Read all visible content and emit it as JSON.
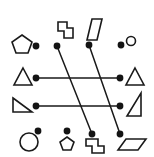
{
  "figure": {
    "width": 154,
    "height": 157,
    "background_color": "#ffffff",
    "stroke_color": "#1a1a1a",
    "dot_color": "#141414"
  },
  "chart_data": {
    "type": "scatter",
    "title": "",
    "xlabel": "",
    "ylabel": "",
    "xlim": [
      0,
      154
    ],
    "ylim": [
      0,
      157
    ],
    "grid": false,
    "legend": "none",
    "nodes": [
      {
        "id": "n1",
        "x": 57,
        "y": 46,
        "label": "top-left-node"
      },
      {
        "id": "n2",
        "x": 89,
        "y": 45,
        "label": "top-mid-node"
      },
      {
        "id": "n3",
        "x": 121,
        "y": 45,
        "label": "top-right-node"
      },
      {
        "id": "n4",
        "x": 36,
        "y": 46,
        "label": "row1-left-node"
      },
      {
        "id": "n5",
        "x": 36,
        "y": 78,
        "label": "row2-left-node"
      },
      {
        "id": "n6",
        "x": 120,
        "y": 78,
        "label": "row2-right-node"
      },
      {
        "id": "n7",
        "x": 36,
        "y": 106,
        "label": "row3-left-node"
      },
      {
        "id": "n8",
        "x": 120,
        "y": 106,
        "label": "row3-right-node"
      },
      {
        "id": "n9",
        "x": 38,
        "y": 131,
        "label": "bottom-left-node"
      },
      {
        "id": "n10",
        "x": 67,
        "y": 131,
        "label": "bottom-mid-node"
      },
      {
        "id": "n11",
        "x": 92,
        "y": 134,
        "label": "bottom-midright-node"
      },
      {
        "id": "n12",
        "x": 120,
        "y": 134,
        "label": "bottom-right-node"
      }
    ],
    "edges": [
      {
        "from": "n5",
        "to": "n6",
        "kind": "horizontal"
      },
      {
        "from": "n7",
        "to": "n8",
        "kind": "horizontal"
      },
      {
        "from": "n1",
        "to": "n11",
        "kind": "diagonal"
      },
      {
        "from": "n2",
        "to": "n12",
        "kind": "diagonal"
      }
    ],
    "shapes": [
      {
        "name": "pentagon",
        "position": "row1-left",
        "x": 22,
        "y": 44
      },
      {
        "name": "s-tetromino",
        "position": "row1-mid",
        "x": 64,
        "y": 28
      },
      {
        "name": "slanted-parallelogram",
        "position": "row1-midright",
        "x": 95,
        "y": 28
      },
      {
        "name": "small-circle",
        "position": "row1-right",
        "x": 131,
        "y": 41
      },
      {
        "name": "triangle-up",
        "position": "row2-left",
        "x": 23,
        "y": 78
      },
      {
        "name": "triangle-up",
        "position": "row2-right",
        "x": 134,
        "y": 78
      },
      {
        "name": "right-triangle",
        "position": "row3-left",
        "x": 22,
        "y": 105
      },
      {
        "name": "right-triangle",
        "position": "row3-right",
        "x": 134,
        "y": 104
      },
      {
        "name": "large-circle",
        "position": "row4-left",
        "x": 29,
        "y": 142
      },
      {
        "name": "small-pentagon",
        "position": "row4-mid",
        "x": 67,
        "y": 144
      },
      {
        "name": "s-tetromino",
        "position": "row4-midright",
        "x": 91,
        "y": 146
      },
      {
        "name": "flat-parallelogram",
        "position": "row4-right",
        "x": 130,
        "y": 145
      }
    ],
    "counts": {
      "nodes": 12,
      "edges": 4,
      "shapes": 12
    }
  }
}
